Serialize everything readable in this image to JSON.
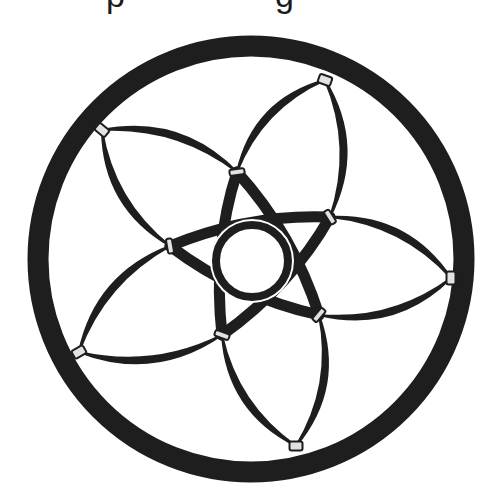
{
  "caption": {
    "visible_fragments": [
      "p",
      "g"
    ],
    "note_clipped": true
  },
  "figure": {
    "colors": {
      "ink": "#1e1e1e",
      "clip_fill": "#e2e2e2",
      "background": "#ffffff"
    },
    "outer_ring": {
      "cx": 251,
      "cy": 259,
      "r": 213,
      "stroke_width": 21
    },
    "inner_ring": {
      "cx": 252,
      "cy": 261,
      "r": 36,
      "stroke_width": 8
    },
    "outer_clips": [
      {
        "x": 325,
        "y": 80,
        "angle": 20
      },
      {
        "x": 451,
        "y": 278,
        "angle": 90
      },
      {
        "x": 296,
        "y": 446,
        "angle": 0
      },
      {
        "x": 79,
        "y": 352,
        "angle": -30
      },
      {
        "x": 102,
        "y": 130,
        "angle": 40
      }
    ],
    "inner_clips": [
      {
        "x": 237,
        "y": 172,
        "angle": -8
      },
      {
        "x": 330,
        "y": 217,
        "angle": 58
      },
      {
        "x": 319,
        "y": 315,
        "angle": -50
      },
      {
        "x": 222,
        "y": 335,
        "angle": 20
      },
      {
        "x": 170,
        "y": 246,
        "angle": 80
      }
    ]
  }
}
